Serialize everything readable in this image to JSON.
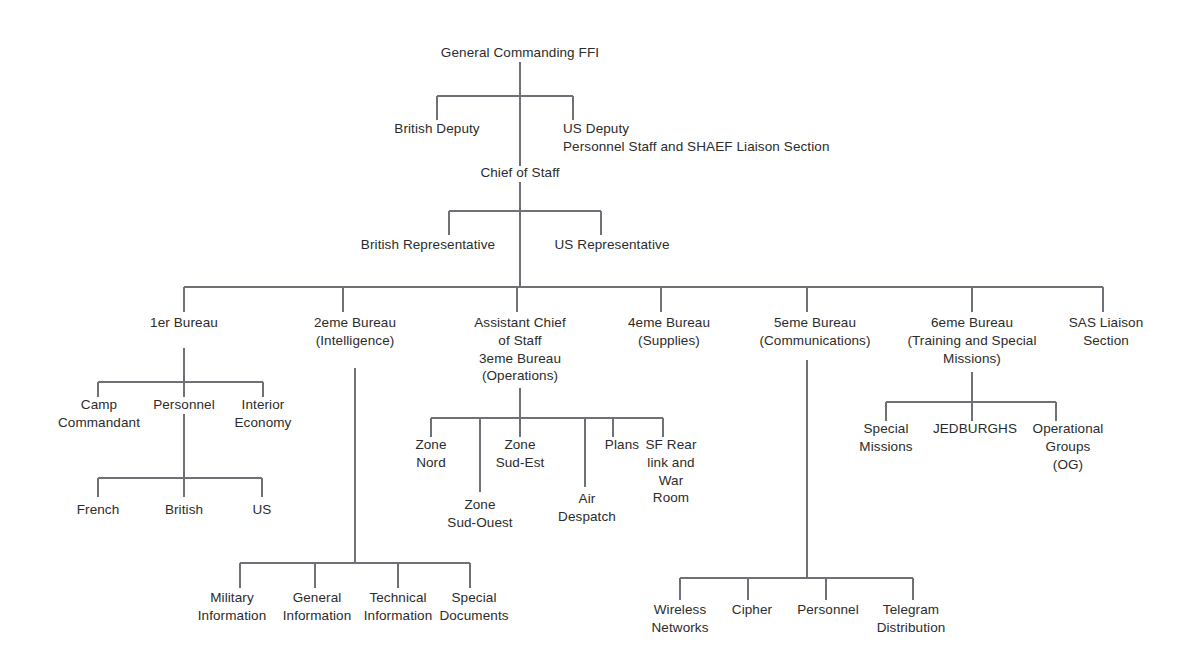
{
  "diagram": {
    "title_node": "General Commanding FFI",
    "type": "organizational-chart",
    "line_color": "#6e7276",
    "text_color": "#2b2b2b",
    "background": "#ffffff"
  },
  "nodes": {
    "general_commanding": "General Commanding FFI",
    "british_deputy": "British Deputy",
    "us_deputy": "US Deputy\nPersonnel Staff and SHAEF Liaison Section",
    "chief_of_staff": "Chief of Staff",
    "british_representative": "British Representative",
    "us_representative": "US Representative",
    "bureau_1er": "1er Bureau",
    "bureau_2eme": "2eme Bureau\n(Intelligence)",
    "bureau_3eme": "Assistant Chief\nof Staff\n3eme Bureau\n(Operations)",
    "bureau_4eme": "4eme Bureau\n(Supplies)",
    "bureau_5eme": "5eme Bureau\n(Communications)",
    "bureau_6eme": "6eme Bureau\n(Training and Special\nMissions)",
    "sas_liaison": "SAS Liaison\nSection",
    "camp_commandant": "Camp\nCommandant",
    "personnel_1er": "Personnel",
    "interior_economy": "Interior\nEconomy",
    "french": "French",
    "british": "British",
    "us": "US",
    "zone_nord": "Zone\nNord",
    "zone_sud_ouest": "Zone\nSud-Ouest",
    "zone_sud_est": "Zone\nSud-Est",
    "air_despatch": "Air\nDespatch",
    "plans": "Plans",
    "sf_rear_link": "SF Rear\nlink and\nWar\nRoom",
    "special_missions": "Special\nMissions",
    "jedburghs": "JEDBURGHS",
    "operational_groups": "Operational\nGroups\n(OG)",
    "military_information": "Military\nInformation",
    "general_information": "General\nInformation",
    "technical_information": "Technical\nInformation",
    "special_documents": "Special\nDocuments",
    "wireless_networks": "Wireless\nNetworks",
    "cipher": "Cipher",
    "personnel_5eme": "Personnel",
    "telegram_distribution": "Telegram\nDistribution"
  },
  "hierarchy": {
    "root": "General Commanding FFI",
    "root_children": [
      "British Deputy",
      "US Deputy",
      "Chief of Staff"
    ],
    "chief_of_staff_children": [
      "British Representative",
      "US Representative"
    ],
    "bureaus": [
      "1er Bureau",
      "2eme Bureau (Intelligence)",
      "Assistant Chief of Staff 3eme Bureau (Operations)",
      "4eme Bureau (Supplies)",
      "5eme Bureau (Communications)",
      "6eme Bureau (Training and Special Missions)",
      "SAS Liaison Section"
    ],
    "bureau_1er_children": [
      "Camp Commandant",
      "Personnel",
      "Interior Economy"
    ],
    "personnel_children": [
      "French",
      "British",
      "US"
    ],
    "bureau_2eme_children": [
      "Military Information",
      "General Information",
      "Technical Information",
      "Special Documents"
    ],
    "bureau_3eme_children": [
      "Zone Nord",
      "Zone Sud-Ouest",
      "Zone Sud-Est",
      "Air Despatch",
      "Plans",
      "SF Rear link and War Room"
    ],
    "bureau_5eme_children": [
      "Wireless Networks",
      "Cipher",
      "Personnel",
      "Telegram Distribution"
    ],
    "bureau_6eme_children": [
      "Special Missions",
      "JEDBURGHS",
      "Operational Groups (OG)"
    ]
  }
}
